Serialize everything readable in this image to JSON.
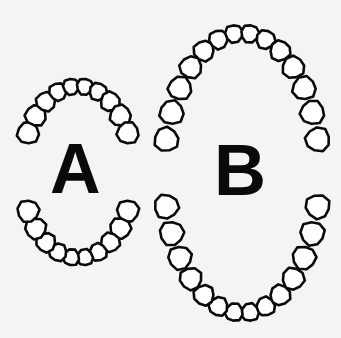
{
  "figure": {
    "background_color": "#f4f4f4",
    "stroke_color": "#0a0a0a",
    "tooth_fill": "#ffffff"
  },
  "arches": [
    {
      "label": "A",
      "size": "small",
      "shape": "short oval",
      "upper_teeth": 10,
      "lower_teeth": 10,
      "cx": 78,
      "cy": 172,
      "rx": 56,
      "ry": 86,
      "gap_deg": 40
    },
    {
      "label": "B",
      "size": "large",
      "shape": "tall elongated oval",
      "upper_teeth": 14,
      "lower_teeth": 14,
      "cx": 242,
      "cy": 173,
      "rx": 78,
      "ry": 140,
      "gap_deg": 16
    }
  ]
}
